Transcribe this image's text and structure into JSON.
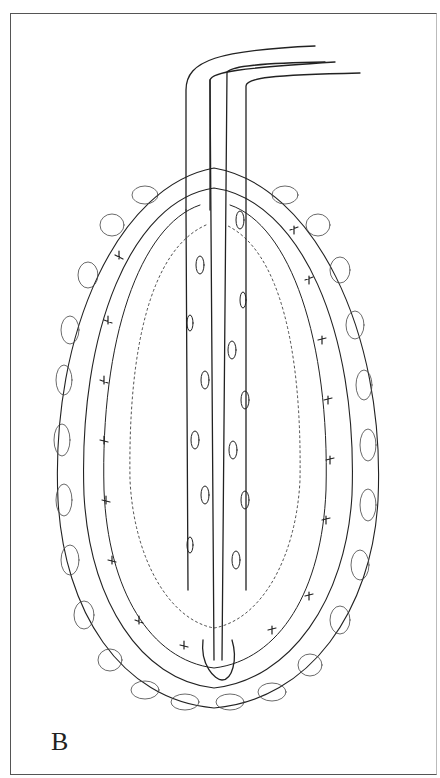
{
  "figure": {
    "panel_label": "B",
    "colors": {
      "ink": "#222222",
      "background": "#ffffff",
      "frame": "#555555"
    }
  }
}
